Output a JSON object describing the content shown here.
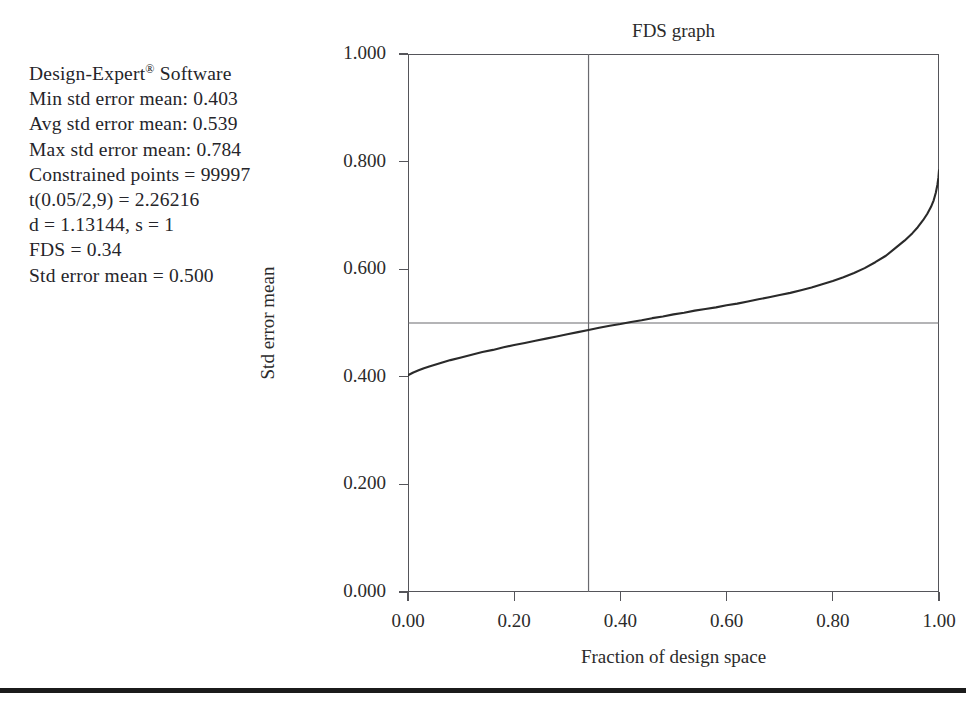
{
  "legend": {
    "lines": [
      "Design-Expert® Software",
      "Min std error mean: 0.403",
      "Avg std error mean: 0.539",
      "Max std error mean: 0.784",
      "Constrained points = 99997",
      "t(0.05/2,9) = 2.26216",
      "d = 1.13144, s = 1",
      "FDS = 0.34",
      "Std error mean = 0.500"
    ]
  },
  "chart_data": {
    "type": "line",
    "title": "FDS graph",
    "xlabel": "Fraction of design space",
    "ylabel": "Std error mean",
    "xlim": [
      0.0,
      1.0
    ],
    "ylim": [
      0.0,
      1.0
    ],
    "grid": false,
    "legend_position": "none",
    "xticks": [
      0.0,
      0.2,
      0.4,
      0.6,
      0.8,
      1.0
    ],
    "xticklabels": [
      "0.00",
      "0.20",
      "0.40",
      "0.60",
      "0.80",
      "1.00"
    ],
    "yticks": [
      0.0,
      0.2,
      0.4,
      0.6,
      0.8,
      1.0
    ],
    "yticklabels": [
      "0.000",
      "0.200",
      "0.400",
      "0.600",
      "0.800",
      "1.000"
    ],
    "series": [
      {
        "name": "Std error mean",
        "color": "#2a2a2a",
        "x": [
          0.0,
          0.01,
          0.02,
          0.03,
          0.04,
          0.06,
          0.08,
          0.1,
          0.12,
          0.14,
          0.16,
          0.18,
          0.2,
          0.22,
          0.24,
          0.26,
          0.28,
          0.3,
          0.32,
          0.34,
          0.36,
          0.38,
          0.4,
          0.42,
          0.44,
          0.46,
          0.48,
          0.5,
          0.52,
          0.54,
          0.56,
          0.58,
          0.6,
          0.62,
          0.64,
          0.66,
          0.68,
          0.7,
          0.72,
          0.74,
          0.76,
          0.78,
          0.8,
          0.82,
          0.84,
          0.86,
          0.88,
          0.9,
          0.92,
          0.935,
          0.95,
          0.96,
          0.97,
          0.978,
          0.985,
          0.99,
          0.994,
          0.997,
          0.999,
          1.0
        ],
        "y": [
          0.403,
          0.408,
          0.412,
          0.416,
          0.419,
          0.425,
          0.431,
          0.436,
          0.441,
          0.446,
          0.45,
          0.455,
          0.459,
          0.463,
          0.467,
          0.471,
          0.475,
          0.479,
          0.483,
          0.487,
          0.491,
          0.495,
          0.498,
          0.502,
          0.505,
          0.509,
          0.512,
          0.516,
          0.519,
          0.523,
          0.526,
          0.529,
          0.533,
          0.536,
          0.54,
          0.544,
          0.548,
          0.552,
          0.556,
          0.561,
          0.566,
          0.572,
          0.578,
          0.585,
          0.593,
          0.602,
          0.613,
          0.625,
          0.641,
          0.653,
          0.667,
          0.678,
          0.691,
          0.703,
          0.716,
          0.728,
          0.742,
          0.757,
          0.771,
          0.784
        ]
      }
    ],
    "reference_lines": [
      {
        "name": "fds-vertical",
        "orientation": "vertical",
        "value": 0.34,
        "color": "#6a6a6f",
        "label": "FDS = 0.34"
      },
      {
        "name": "std-error-horizontal",
        "orientation": "horizontal",
        "value": 0.5,
        "color": "#6a6a6f",
        "label": "Std error mean = 0.500"
      }
    ],
    "annotations": {
      "min_std_error_mean": 0.403,
      "avg_std_error_mean": 0.539,
      "max_std_error_mean": 0.784,
      "constrained_points": 99997,
      "t_value": 2.26216,
      "d": 1.13144,
      "s": 1
    }
  }
}
